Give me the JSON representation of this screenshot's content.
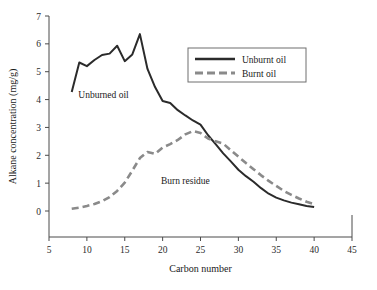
{
  "chart_data": {
    "type": "line",
    "title": "",
    "xlabel": "Carbon number",
    "ylabel": "Alkane concentration (mg/g)",
    "xlim": [
      5,
      45
    ],
    "ylim": [
      0,
      7
    ],
    "xticks": [
      5,
      10,
      15,
      20,
      25,
      30,
      35,
      40,
      45
    ],
    "xtick_labels": [
      "5",
      "10",
      "15",
      "20",
      "25",
      "30",
      "35",
      "40",
      "45"
    ],
    "yticks": [
      0,
      1,
      2,
      3,
      4,
      5,
      6,
      7
    ],
    "ytick_labels": [
      "0",
      "1",
      "2",
      "3",
      "4",
      "5",
      "6",
      "7"
    ],
    "grid": false,
    "legend_position": "upper-right",
    "series": [
      {
        "name": "Unburnt oil",
        "style": "solid",
        "color": "#2b2b2b",
        "x": [
          8,
          9,
          10,
          11,
          12,
          13,
          14,
          15,
          16,
          17,
          18,
          19,
          20,
          21,
          22,
          23,
          24,
          25,
          26,
          27,
          28,
          29,
          30,
          31,
          32,
          33,
          34,
          35,
          36,
          37,
          38,
          39,
          40
        ],
        "values": [
          4.27,
          5.33,
          5.2,
          5.42,
          5.6,
          5.65,
          5.93,
          5.38,
          5.62,
          6.35,
          5.1,
          4.45,
          3.95,
          3.88,
          3.62,
          3.43,
          3.25,
          3.1,
          2.72,
          2.4,
          2.07,
          1.78,
          1.48,
          1.25,
          1.05,
          0.82,
          0.62,
          0.48,
          0.38,
          0.3,
          0.24,
          0.18,
          0.14
        ]
      },
      {
        "name": "Burnt oil",
        "style": "dashed",
        "color": "#8a8a8a",
        "x": [
          8,
          9,
          10,
          11,
          12,
          13,
          14,
          15,
          16,
          17,
          18,
          19,
          20,
          21,
          22,
          23,
          24,
          25,
          26,
          27,
          28,
          29,
          30,
          31,
          32,
          33,
          34,
          35,
          36,
          37,
          38,
          39,
          40
        ],
        "values": [
          0.08,
          0.12,
          0.18,
          0.25,
          0.35,
          0.5,
          0.72,
          1.02,
          1.45,
          1.9,
          2.12,
          2.05,
          2.28,
          2.4,
          2.55,
          2.75,
          2.87,
          2.8,
          2.6,
          2.5,
          2.42,
          2.18,
          1.95,
          1.72,
          1.5,
          1.28,
          1.08,
          0.9,
          0.72,
          0.58,
          0.45,
          0.33,
          0.25
        ]
      }
    ],
    "annotations": [
      {
        "text": "Unburned oil",
        "x": 12.2,
        "y": 4.05
      },
      {
        "text": "Burn residue",
        "x": 23.0,
        "y": 0.98
      }
    ]
  },
  "legend": {
    "entries": [
      {
        "label": "Unburnt oil"
      },
      {
        "label": "Burnt oil"
      }
    ]
  }
}
